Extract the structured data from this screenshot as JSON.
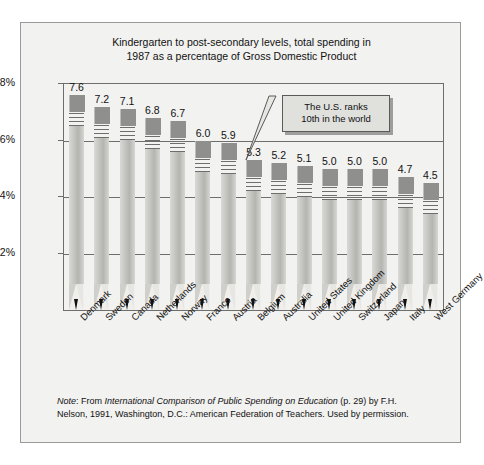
{
  "figure": {
    "title_line1": "Kindergarten to post-secondary levels, total spending in",
    "title_line2": "1987 as a percentage of Gross Domestic Product",
    "annotation_line1": "The U.S. ranks",
    "annotation_line2": "10th in the world",
    "footnote_note_label": "Note",
    "footnote_part1": ": From ",
    "footnote_source_title": "International Comparison of Public Spending on Education",
    "footnote_part2": " (p. 29) by F.H. Nelson, 1991, Washington, D.C.: American Federation of Teachers. Used by permission."
  },
  "chart_data": {
    "type": "bar",
    "title": "Kindergarten to post-secondary levels, total spending in 1987 as a percentage of Gross Domestic Product",
    "xlabel": "",
    "ylabel": "",
    "ylim": [
      0,
      8
    ],
    "grid": true,
    "legend": "none",
    "ytick_labels": [
      "8%",
      "6%",
      "4%",
      "2%"
    ],
    "ytick_values": [
      8,
      6,
      4,
      2
    ],
    "categories": [
      "Denmark",
      "Sweden",
      "Canada",
      "Netherlands",
      "Norway",
      "France",
      "Austria",
      "Belgium",
      "Australia",
      "United States",
      "United Kingdom",
      "Switzerland",
      "Japan",
      "Italy",
      "West Germany"
    ],
    "values": [
      7.6,
      7.2,
      7.1,
      6.8,
      6.7,
      6.0,
      5.9,
      5.3,
      5.2,
      5.1,
      5.0,
      5.0,
      5.0,
      4.7,
      4.5
    ],
    "value_labels": [
      "7.6",
      "7.2",
      "7.1",
      "6.8",
      "6.7",
      "6.0",
      "5.9",
      "5.3",
      "5.2",
      "5.1",
      "5.0",
      "5.0",
      "5.0",
      "4.7",
      "4.5"
    ],
    "annotations": [
      {
        "text": "The U.S. ranks 10th in the world",
        "target_category": "United States",
        "target_value": 5.1
      }
    ]
  },
  "colors": {
    "page_background": "#ffffff",
    "panel_background": "#f2f2f0",
    "panel_border": "#9a9a98",
    "axis_line": "#6e6e6c",
    "pencil_ferrule": "#8f8f8d",
    "pencil_shaft": "#c2c2bf",
    "pencil_wood": "#f0efec",
    "pencil_tip": "#111111",
    "callout_background": "#e0e0dd",
    "callout_border": "#5a5a58",
    "text": "#111111"
  }
}
